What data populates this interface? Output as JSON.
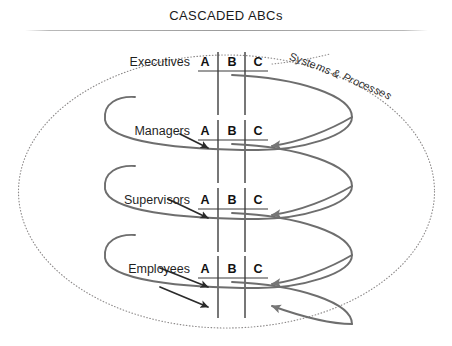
{
  "slide": {
    "title": "CASCADED ABCs",
    "background_color": "#ffffff",
    "title_color": "#1a1a1a",
    "rule_color": "#9a9a9a"
  },
  "diagram": {
    "type": "cascade",
    "boundary": {
      "shape": "ellipse",
      "style": "dotted",
      "color": "#8d8a8a",
      "label": "Systems & Processes"
    },
    "column_headers": [
      "A",
      "B",
      "C"
    ],
    "levels": [
      {
        "label": "Executives",
        "columns": [
          "A",
          "B",
          "C"
        ]
      },
      {
        "label": "Managers",
        "columns": [
          "A",
          "B",
          "C"
        ]
      },
      {
        "label": "Supervisors",
        "columns": [
          "A",
          "B",
          "C"
        ]
      },
      {
        "label": "Employees",
        "columns": [
          "A",
          "B",
          "C"
        ]
      }
    ],
    "flow": {
      "cascade_arrow_color": "#6e6e6e",
      "down_arrow_color": "#2b2b2b",
      "divider_color": "#4a4a4a",
      "underline_color": "#3a3a3a"
    }
  }
}
